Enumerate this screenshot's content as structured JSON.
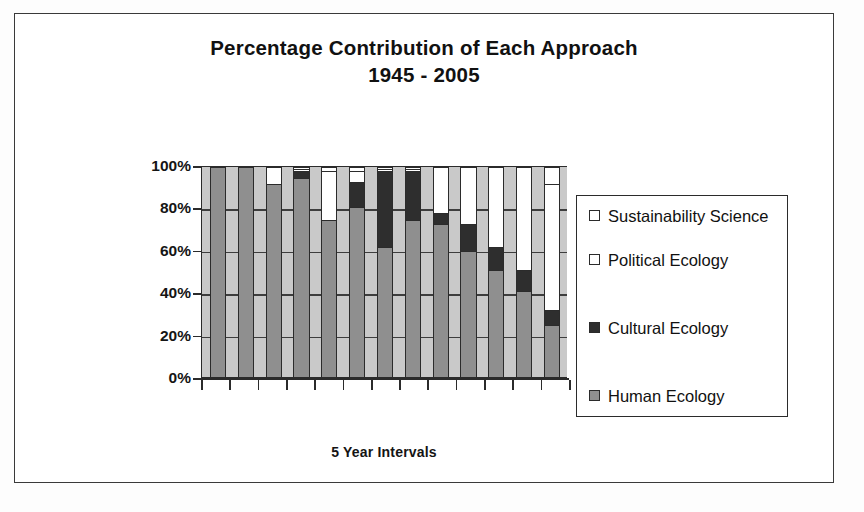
{
  "chart_data": {
    "type": "bar",
    "subtype": "stacked-100-percent",
    "title": "Percentage Contribution of Each Approach",
    "subtitle": "1945 - 2005",
    "xlabel": "5 Year Intervals",
    "ylabel": "",
    "ylim": [
      0,
      100
    ],
    "ytick_labels": [
      "100%",
      "80%",
      "60%",
      "40%",
      "20%",
      "0%"
    ],
    "ytick_values": [
      100,
      80,
      60,
      40,
      20,
      0
    ],
    "grid": true,
    "grid_axis": "y",
    "legend_position": "right",
    "categories": [
      "1945",
      "1950",
      "1955",
      "1960",
      "1965",
      "1970",
      "1975",
      "1980",
      "1985",
      "1990",
      "1995",
      "2000",
      "2005"
    ],
    "series": [
      {
        "name": "Human Ecology",
        "color": "#8f8f8f",
        "values": [
          100,
          100,
          92,
          95,
          75,
          81,
          62,
          75,
          73,
          60,
          51,
          41,
          25
        ]
      },
      {
        "name": "Cultural Ecology",
        "color": "#2e2e2e",
        "values": [
          0,
          0,
          0,
          3,
          0,
          12,
          36,
          23,
          5,
          13,
          11,
          10,
          7
        ]
      },
      {
        "name": "Political Ecology",
        "color": "#ffffff",
        "values": [
          0,
          0,
          8,
          1,
          23,
          5,
          1,
          1,
          22,
          27,
          38,
          49,
          60
        ]
      },
      {
        "name": "Sustainability Science",
        "color": "#ffffff",
        "values": [
          0,
          0,
          0,
          1,
          2,
          2,
          1,
          1,
          0,
          0,
          0,
          0,
          8
        ]
      }
    ],
    "legend_entries": [
      "Sustainability Science",
      "Political Ecology",
      "Cultural Ecology",
      "Human Ecology"
    ]
  },
  "colors": {
    "human": "#8f8f8f",
    "cultural": "#2e2e2e",
    "political": "#ffffff",
    "sustainability": "#ffffff",
    "plot_background": "#c9c9c9",
    "axis": "#2b2b2b",
    "frame": "#3a3a3a"
  }
}
